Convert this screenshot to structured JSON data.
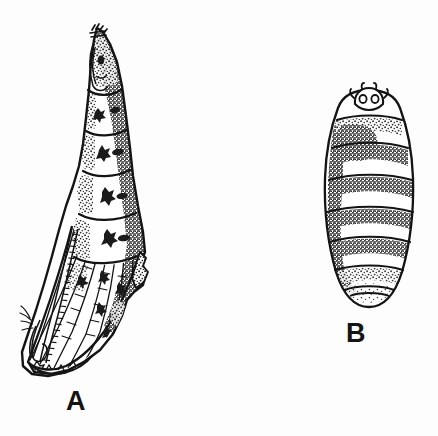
{
  "figure": {
    "background_color": "#fdfdfd",
    "ink_color": "#141414",
    "width": 438,
    "height": 436,
    "style": "black-and-white stippled scientific line drawing",
    "panels": [
      {
        "id": "A",
        "label": "A",
        "label_x": 66,
        "label_y": 388,
        "view": "lateral",
        "subject": "insect pupa, lateral view with wing cases and antenna",
        "bbox": {
          "x": 20,
          "y": 26,
          "width": 126,
          "height": 350
        },
        "abdominal_segments": 5,
        "features": [
          "pointed cephalic end",
          "segmented abdomen with stippled shading",
          "wing case with radiating veins",
          "ladder-like antenna sheath",
          "cremaster at posterior tip"
        ]
      },
      {
        "id": "B",
        "label": "B",
        "label_x": 346,
        "label_y": 320,
        "view": "dorsal",
        "subject": "insect pupa, dorsal view, oval segmented body",
        "bbox": {
          "x": 324,
          "y": 88,
          "width": 90,
          "height": 222
        },
        "abdominal_segments": 8,
        "features": [
          "head capsule with two eye spots",
          "paired lateral tubercles on head",
          "eight transverse segment bands",
          "stippled shading concentrated at segment margins",
          "rounded terminal segment"
        ]
      }
    ]
  }
}
